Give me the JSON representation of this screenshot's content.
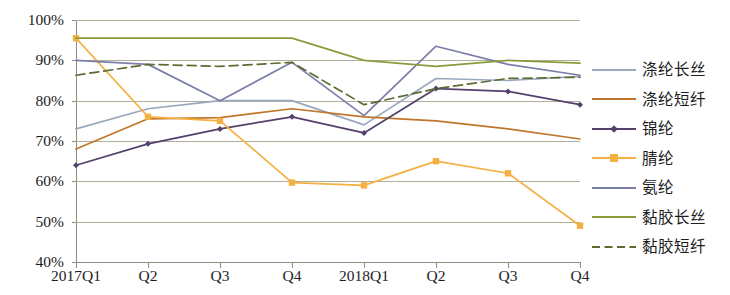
{
  "chart_data": {
    "type": "line",
    "title": "",
    "subtitle": "",
    "xlabel": "",
    "ylabel": "",
    "categories": [
      "2017Q1",
      "Q2",
      "Q3",
      "Q4",
      "2018Q1",
      "Q2",
      "Q3",
      "Q4"
    ],
    "ylim": [
      40,
      100
    ],
    "ytick_labels": [
      "100%",
      "90%",
      "80%",
      "70%",
      "60%",
      "50%",
      "40%"
    ],
    "ytick_values": [
      100,
      90,
      80,
      70,
      60,
      50,
      40
    ],
    "grid": true,
    "legend_position": "right",
    "series": [
      {
        "name": "涤纶长丝",
        "color": "#9aa7bd",
        "style": "solid",
        "marker": "none",
        "values": [
          73,
          78,
          80,
          80,
          74,
          85.5,
          85,
          86
        ]
      },
      {
        "name": "涤纶短纤",
        "color": "#c0762a",
        "style": "solid",
        "marker": "none",
        "values": [
          68,
          75.5,
          75.8,
          78,
          76,
          75,
          73,
          70.5
        ]
      },
      {
        "name": "锦纶",
        "color": "#53406b",
        "style": "solid",
        "marker": "diamond",
        "values": [
          64,
          69.3,
          73,
          76,
          72,
          83,
          82.3,
          79
        ]
      },
      {
        "name": "腈纶",
        "color": "#f4b042",
        "style": "solid",
        "marker": "square",
        "values": [
          95.5,
          76,
          75,
          59.7,
          59,
          65,
          62,
          49
        ]
      },
      {
        "name": "氨纶",
        "color": "#7b7fa8",
        "style": "solid",
        "marker": "none",
        "values": [
          90,
          89,
          80,
          89.5,
          76.3,
          93.5,
          89,
          86.3
        ]
      },
      {
        "name": "黏胶长丝",
        "color": "#8a9b3c",
        "style": "solid",
        "marker": "none",
        "values": [
          95.5,
          95.5,
          95.5,
          95.5,
          90,
          88.5,
          90,
          89.3
        ]
      },
      {
        "name": "黏胶短纤",
        "color": "#5c6b30",
        "style": "dashed",
        "marker": "none",
        "values": [
          86.3,
          89,
          88.5,
          89.5,
          79,
          83,
          85.5,
          85.8
        ]
      }
    ]
  },
  "legend": {
    "items": [
      {
        "label": "涤纶长丝"
      },
      {
        "label": "涤纶短纤"
      },
      {
        "label": "锦纶"
      },
      {
        "label": "腈纶"
      },
      {
        "label": "氨纶"
      },
      {
        "label": "黏胶长丝"
      },
      {
        "label": "黏胶短纤"
      }
    ]
  }
}
